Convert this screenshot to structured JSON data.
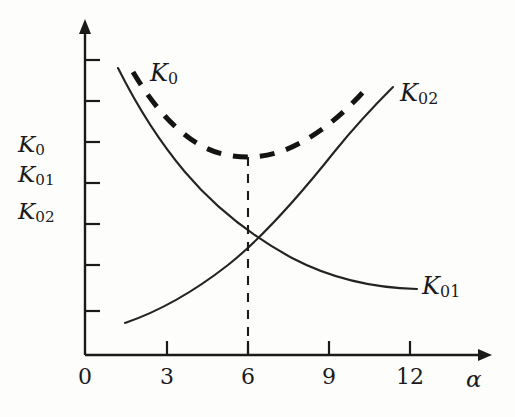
{
  "chart_data": {
    "type": "line",
    "title": "",
    "xlabel": "α",
    "ylabel": "K0 / K01 / K02",
    "xlim": [
      0,
      14.5
    ],
    "ylim": [
      0,
      12.3
    ],
    "grid": false,
    "legend": "inline-curve-labels",
    "x_ticks": [
      "0",
      "3",
      "6",
      "9",
      "12"
    ],
    "x_tick_values": [
      0,
      3,
      6,
      9,
      12
    ],
    "y_ticks_unlabeled_count": 7,
    "annotations": [
      {
        "name": "optimum-dropline",
        "style": "dashed-vertical",
        "x": 6,
        "from_y": 7.55,
        "to_y": 0,
        "note": "vertical dashed line from minimum of K0 down to the alpha axis at alpha = 6"
      },
      {
        "name": "curve-intersection",
        "x": 6,
        "y": 4.0,
        "note": "K01 and K02 cross at alpha = 6"
      },
      {
        "name": "k0-minimum",
        "x": 6,
        "y": 7.55,
        "note": "minimum of total cost curve K0 at alpha = 6"
      }
    ],
    "series": [
      {
        "name": "K0",
        "label": "K0",
        "label_html": "K<sub>0</sub>",
        "style": "dashed",
        "linewidth": "thick",
        "color": "#141414",
        "description": "U-shaped total cost curve, sum of K01 and K02, minimum at alpha = 6",
        "x": [
          1.75,
          2.25,
          2.75,
          3.25,
          3.75,
          4.25,
          4.75,
          5.25,
          5.75,
          6.0,
          6.25,
          6.75,
          7.25,
          7.75,
          8.25,
          8.75,
          9.25,
          9.75,
          10.25,
          10.6
        ],
        "y": [
          11.55,
          10.65,
          9.95,
          9.4,
          8.95,
          8.55,
          8.2,
          7.9,
          7.65,
          7.55,
          7.6,
          7.75,
          8.0,
          8.35,
          8.8,
          9.3,
          9.85,
          10.45,
          11.1,
          11.55
        ]
      },
      {
        "name": "K01",
        "label": "K01",
        "label_html": "K<sub>01</sub>",
        "style": "solid",
        "linewidth": "thin",
        "color": "#232323",
        "description": "Decreasing hyperbolic cost component",
        "x": [
          1.25,
          1.75,
          2.25,
          2.75,
          3.25,
          3.75,
          4.25,
          4.75,
          5.25,
          5.75,
          6.0,
          6.5,
          7.0,
          7.5,
          8.0,
          8.5,
          9.0,
          9.5,
          10.0,
          10.75,
          11.5,
          12.3
        ],
        "y": [
          11.85,
          9.95,
          8.5,
          7.45,
          6.6,
          5.9,
          5.35,
          4.85,
          4.45,
          4.15,
          4.0,
          3.75,
          3.5,
          3.3,
          3.1,
          2.95,
          2.8,
          2.65,
          2.55,
          2.4,
          2.25,
          2.1
        ]
      },
      {
        "name": "K02",
        "label": "K02",
        "label_html": "K<sub>02</sub>",
        "style": "solid",
        "linewidth": "thin",
        "color": "#232323",
        "description": "Increasing cost component",
        "x": [
          1.5,
          2.0,
          2.5,
          3.0,
          3.5,
          4.0,
          4.5,
          5.0,
          5.5,
          6.0,
          6.5,
          7.0,
          7.5,
          8.0,
          8.5,
          9.0,
          9.5,
          10.0,
          10.5,
          11.0,
          11.4
        ],
        "y": [
          1.2,
          1.5,
          1.8,
          2.1,
          2.4,
          2.75,
          3.05,
          3.4,
          3.7,
          4.0,
          4.4,
          4.8,
          5.25,
          5.7,
          6.2,
          6.75,
          7.35,
          8.05,
          8.85,
          9.75,
          10.6
        ]
      }
    ]
  },
  "axes": {
    "x_title": "α",
    "y_labels": [
      "K0",
      "K01",
      "K02"
    ],
    "x_tick_labels": [
      "0",
      "3",
      "6",
      "9",
      "12"
    ]
  },
  "curve_labels": {
    "k0": "K0",
    "k01": "K01",
    "k02": "K02"
  },
  "colors": {
    "ink": "#1a1a1a",
    "curve": "#232323",
    "dashed_curve": "#141414",
    "background": "#fdfdfc"
  }
}
